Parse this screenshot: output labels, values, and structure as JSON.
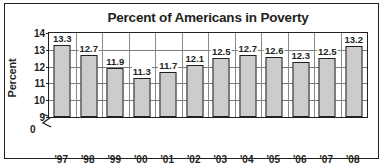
{
  "chart_data": {
    "type": "bar",
    "title": "Percent of Americans in Poverty",
    "xlabel": "",
    "ylabel": "Percent",
    "categories": [
      "'97",
      "'98",
      "'99",
      "'00",
      "'01",
      "'02",
      "'03",
      "'04",
      "'05",
      "'06",
      "'07",
      "'08"
    ],
    "values": [
      13.3,
      12.7,
      11.9,
      11.3,
      11.7,
      12.1,
      12.5,
      12.7,
      12.6,
      12.3,
      12.5,
      13.2
    ],
    "data_labels": [
      "13.3",
      "12.7",
      "11.9",
      "11.3",
      "11.7",
      "12.1",
      "12.5",
      "12.7",
      "12.6",
      "12.3",
      "12.5",
      "13.2"
    ],
    "ylim": [
      9,
      14
    ],
    "y_ticks": [
      9,
      10,
      11,
      12,
      13,
      14
    ],
    "y_tick_labels": [
      "9",
      "10",
      "11",
      "12",
      "13",
      "14"
    ],
    "zero_tick_label": "0",
    "axis_break": true,
    "grid": "horizontal",
    "legend": "none",
    "bar_color": "#cccccc",
    "bar_edge_color": "#231f20",
    "text_color": "#231f20",
    "background_color": "#ffffff"
  }
}
